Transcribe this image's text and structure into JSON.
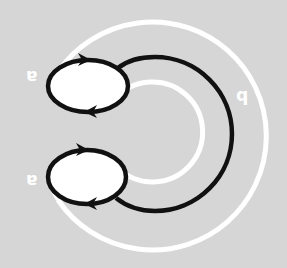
{
  "diagram": {
    "background_color": "#d6d6d6",
    "stroke_color": "#111111",
    "fill_color": "#ffffff",
    "orientation_note": "labels rendered upside down (rotated 180°)",
    "labels": [
      {
        "id": "label-a-top",
        "text": "a",
        "x": 26,
        "y": 68
      },
      {
        "id": "label-a-bottom",
        "text": "a",
        "x": 26,
        "y": 172
      },
      {
        "id": "label-b",
        "text": "b",
        "x": 234,
        "y": 88
      }
    ],
    "loops": [
      {
        "id": "loop-top",
        "cx": 88,
        "cy": 86,
        "rx": 40,
        "ry": 26,
        "arrow_top": "right",
        "arrow_bottom": "left"
      },
      {
        "id": "loop-bottom",
        "cx": 87,
        "cy": 177,
        "rx": 39,
        "ry": 27,
        "arrow_top": "right",
        "arrow_bottom": "left"
      }
    ],
    "rings": [
      {
        "id": "inner-white-ring",
        "cx": 153,
        "cy": 132,
        "r": 50,
        "color": "#ffffff"
      },
      {
        "id": "outer-white-ring",
        "cx": 154,
        "cy": 136,
        "r": 114,
        "color": "#ffffff"
      }
    ],
    "connector": {
      "id": "black-arc",
      "cx": 155,
      "cy": 134,
      "r": 78
    }
  }
}
